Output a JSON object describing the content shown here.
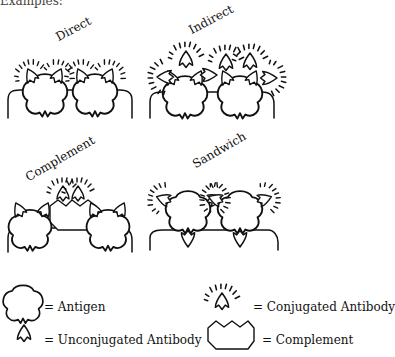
{
  "header": {
    "text": "Examples:"
  },
  "panels": [
    {
      "label": "Direct"
    },
    {
      "label": "Indirect"
    },
    {
      "label": "Complement"
    },
    {
      "label": "Sandwich"
    }
  ],
  "legend": [
    {
      "symbol": "antigen-icon",
      "text": "= Antigen"
    },
    {
      "symbol": "unconjugated-antibody-icon",
      "text": "= Unconjugated Antibody"
    },
    {
      "symbol": "conjugated-antibody-icon",
      "text": "= Conjugated Antibody"
    },
    {
      "symbol": "complement-icon",
      "text": "= Complement"
    }
  ],
  "colors": {
    "ink": "#111111",
    "background": "#ffffff"
  }
}
